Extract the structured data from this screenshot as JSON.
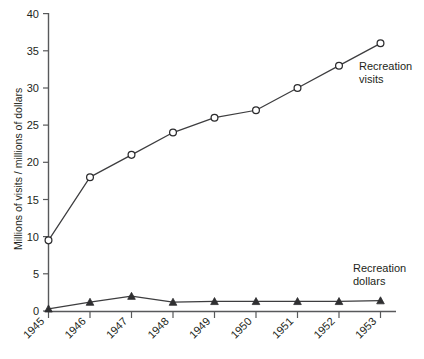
{
  "chart_data": {
    "type": "line",
    "title": "",
    "xlabel": "",
    "ylabel": "Millions of visits / millions of dollars",
    "categories": [
      "1945",
      "1946",
      "1947",
      "1948",
      "1949",
      "1950",
      "1951",
      "1952",
      "1953"
    ],
    "x": [
      1945,
      1946,
      1947,
      1948,
      1949,
      1950,
      1951,
      1952,
      1953
    ],
    "xlim": [
      1945,
      1953
    ],
    "ylim": [
      0,
      40
    ],
    "yticks": [
      0,
      5,
      10,
      15,
      20,
      25,
      30,
      35,
      40
    ],
    "ytick_labels": [
      "0",
      "5",
      "10",
      "15",
      "20",
      "25",
      "30",
      "35",
      "40"
    ],
    "grid": false,
    "legend_position": "inline-annotations",
    "series": [
      {
        "name": "Recreation visits",
        "marker": "circle-open",
        "color": "#2b2b2d",
        "values": [
          9.5,
          18,
          21,
          24,
          26,
          27,
          30,
          33,
          36
        ]
      },
      {
        "name": "Recreation dollars",
        "marker": "triangle-filled",
        "color": "#2f2f31",
        "values": [
          0.3,
          1.2,
          2.0,
          1.2,
          1.3,
          1.3,
          1.3,
          1.3,
          1.4
        ]
      }
    ],
    "annotations": [
      {
        "text_line1": "Recreation",
        "text_line2": "visits",
        "anchor_series": "Recreation visits"
      },
      {
        "text_line1": "Recreation",
        "text_line2": "dollars",
        "anchor_series": "Recreation dollars"
      }
    ]
  },
  "colors": {
    "axis": "#58595b",
    "line": "#3d3d3f",
    "marker_fill": "#ffffff",
    "marker_stroke": "#2b2b2d",
    "text": "#231f20",
    "background": "#ffffff"
  },
  "axis": {
    "y_title": "Millions of visits / millions of dollars",
    "y_labels": [
      "40",
      "35",
      "30",
      "25",
      "20",
      "15",
      "10",
      "5",
      "0"
    ],
    "x_labels": [
      "1945",
      "1946",
      "1947",
      "1948",
      "1949",
      "1950",
      "1951",
      "1952",
      "1953"
    ]
  },
  "annotations": {
    "visits_line1": "Recreation",
    "visits_line2": "visits",
    "dollars_line1": "Recreation",
    "dollars_line2": "dollars"
  }
}
